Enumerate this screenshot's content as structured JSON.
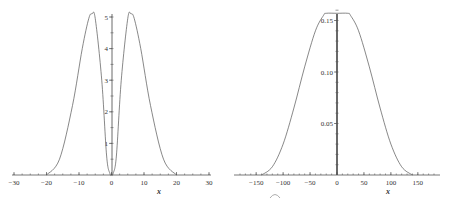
{
  "chart_data": [
    {
      "type": "line",
      "title": "",
      "xlabel": "x",
      "ylabel": "",
      "xlim": [
        -30,
        30
      ],
      "ylim": [
        0,
        5.1
      ],
      "x_ticks": [
        -30,
        -20,
        -10,
        0,
        10,
        20,
        30
      ],
      "y_ticks": [
        1,
        2,
        3,
        4,
        5
      ],
      "grid": false,
      "series": [
        {
          "name": "curve",
          "description": "Two symmetric bumps; zero near x=0 and for |x|>=20, peaks ~5.1 at x≈±6",
          "x": [
            -20,
            -16,
            -12,
            -9,
            -7,
            -6,
            -5,
            -3,
            -1.5,
            -0.5,
            0,
            0.5,
            1.5,
            3,
            5,
            6,
            7,
            9,
            12,
            16,
            20
          ],
          "y": [
            0,
            0.5,
            2.2,
            4.0,
            4.95,
            5.1,
            4.95,
            3.0,
            0.6,
            0.05,
            0,
            0.05,
            0.6,
            3.0,
            4.95,
            5.1,
            4.95,
            4.0,
            2.2,
            0.5,
            0
          ]
        }
      ]
    },
    {
      "type": "line",
      "title": "",
      "xlabel": "x",
      "ylabel": "",
      "xlim": [
        -180,
        180
      ],
      "ylim": [
        0,
        0.16
      ],
      "x_ticks": [
        -150,
        -100,
        -50,
        0,
        50,
        100,
        150
      ],
      "y_ticks": [
        0.05,
        0.1,
        0.15
      ],
      "grid": false,
      "series": [
        {
          "name": "curve",
          "description": "Symmetric bell with flat top ~0.157 for |x|<=20, zero for |x|>=140",
          "x": [
            -140,
            -120,
            -100,
            -80,
            -60,
            -40,
            -25,
            -20,
            0,
            20,
            25,
            40,
            60,
            80,
            100,
            120,
            140
          ],
          "y": [
            0,
            0.008,
            0.03,
            0.065,
            0.105,
            0.14,
            0.155,
            0.157,
            0.157,
            0.157,
            0.155,
            0.14,
            0.105,
            0.065,
            0.03,
            0.008,
            0
          ]
        }
      ]
    }
  ],
  "labels": {
    "left": {
      "x_ticks": [
        "-30",
        "-20",
        "-10",
        "0",
        "10",
        "20",
        "30"
      ],
      "y_ticks": [
        "1",
        "2",
        "3",
        "4",
        "5"
      ],
      "xlabel": "x"
    },
    "right": {
      "x_ticks": [
        "-150",
        "-100",
        "-50",
        "0",
        "50",
        "100",
        "150"
      ],
      "y_ticks": [
        "0.05",
        "0.10",
        "0.15"
      ],
      "xlabel": "x"
    }
  }
}
